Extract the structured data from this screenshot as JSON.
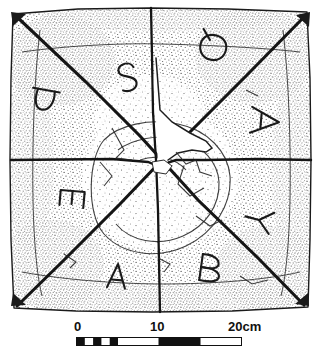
{
  "figure": {
    "kind": "archaeological-line-drawing",
    "technique": "stipple-and-line ink drawing",
    "colors": {
      "ink": "#1a1a1a",
      "stipple": "#3a3a3a",
      "paper": "#ffffff",
      "loss_fill": "#ffffff"
    }
  },
  "artifact": {
    "outline_shape": "square slab, slightly irregular edges",
    "surface_marks": [
      {
        "name": "diagonal-incision-nw-se",
        "description": "deep incised line from top-left corner to bottom-right corner"
      },
      {
        "name": "diagonal-incision-ne-sw",
        "description": "deep incised line from top-right corner to bottom-left corner"
      },
      {
        "name": "horizontal-break-line",
        "description": "break / join running across the middle of the slab"
      },
      {
        "name": "vertical-break-line",
        "description": "break / join running from top edge to bottom edge through the centre"
      },
      {
        "name": "central-loss",
        "description": "triangular area of missing surface just above centre, left blank"
      }
    ],
    "letters": [
      {
        "id": "letter-thorn-upper-left",
        "glyph": "Þ",
        "quadrant": "upper-left",
        "rotation_deg": 100,
        "x": 45,
        "y": 101
      },
      {
        "id": "letter-s-upper-left",
        "glyph": "S",
        "quadrant": "upper-left",
        "rotation_deg": 165,
        "x": 127,
        "y": 78
      },
      {
        "id": "letter-q-upper-right",
        "glyph": "Q",
        "quadrant": "upper-right",
        "rotation_deg": 195,
        "x": 213,
        "y": 48
      },
      {
        "id": "letter-a-upper-right",
        "glyph": "A",
        "quadrant": "upper-right",
        "rotation_deg": 95,
        "x": 265,
        "y": 121
      },
      {
        "id": "letter-e-lower-left",
        "glyph": "E",
        "quadrant": "lower-left",
        "rotation_deg": 95,
        "x": 72,
        "y": 199
      },
      {
        "id": "letter-a-lower-left",
        "glyph": "A",
        "quadrant": "lower-left",
        "rotation_deg": 5,
        "x": 117,
        "y": 276
      },
      {
        "id": "letter-b-lower-right",
        "glyph": "B",
        "quadrant": "lower-right",
        "rotation_deg": 8,
        "x": 208,
        "y": 268
      },
      {
        "id": "letter-y-lower-right",
        "glyph": "Y",
        "quadrant": "lower-right",
        "rotation_deg": 105,
        "x": 259,
        "y": 220
      }
    ]
  },
  "scale_bar": {
    "name": "scale-bar",
    "unit_text": "20cm",
    "ticks": [
      {
        "label": "0",
        "value": 0
      },
      {
        "label": "10",
        "value": 10
      },
      {
        "label": "20cm",
        "value": 20
      }
    ],
    "segments_cm": 20,
    "segment_pattern": "alternating black and white bars, 1cm steps for first 5cm then 5cm blocks"
  }
}
